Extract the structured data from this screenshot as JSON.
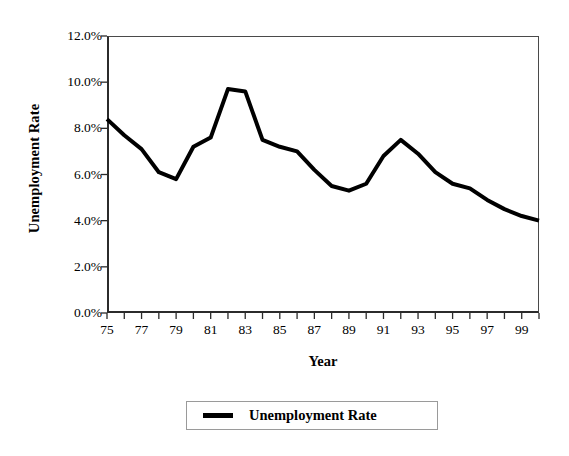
{
  "chart_data": {
    "type": "line",
    "title": "",
    "xlabel": "Year",
    "ylabel": "Unemployment Rate",
    "xlim": [
      75,
      100
    ],
    "ylim": [
      0,
      12
    ],
    "grid": false,
    "legend_position": "bottom-center",
    "y_tick_labels": [
      "0.0%",
      "2.0%",
      "4.0%",
      "6.0%",
      "8.0%",
      "10.0%",
      "12.0%"
    ],
    "y_tick_values": [
      0,
      2,
      4,
      6,
      8,
      10,
      12
    ],
    "x_tick_labels": [
      "75",
      "77",
      "79",
      "81",
      "83",
      "85",
      "87",
      "89",
      "91",
      "93",
      "95",
      "97",
      "99"
    ],
    "x_tick_values": [
      75,
      77,
      79,
      81,
      83,
      85,
      87,
      89,
      91,
      93,
      95,
      97,
      99
    ],
    "x_minor_ticks": [
      75,
      76,
      77,
      78,
      79,
      80,
      81,
      82,
      83,
      84,
      85,
      86,
      87,
      88,
      89,
      90,
      91,
      92,
      93,
      94,
      95,
      96,
      97,
      98,
      99,
      100
    ],
    "x": [
      75,
      76,
      77,
      78,
      79,
      80,
      81,
      82,
      83,
      84,
      85,
      86,
      87,
      88,
      89,
      90,
      91,
      92,
      93,
      94,
      95,
      96,
      97,
      98,
      99,
      100
    ],
    "series": [
      {
        "name": "Unemployment Rate",
        "color": "#000000",
        "line_width": 4,
        "values": [
          8.4,
          7.7,
          7.1,
          6.1,
          5.8,
          7.2,
          7.6,
          9.7,
          9.6,
          7.5,
          7.2,
          7.0,
          6.2,
          5.5,
          5.3,
          5.6,
          6.8,
          7.5,
          6.9,
          6.1,
          5.6,
          5.4,
          4.9,
          4.5,
          4.2,
          4.0
        ]
      }
    ]
  },
  "legend": {
    "entries": [
      {
        "label": "Unemployment Rate",
        "color": "#000000"
      }
    ]
  }
}
